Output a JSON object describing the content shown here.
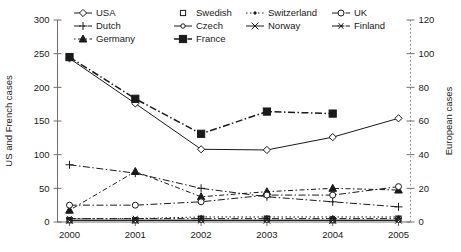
{
  "chart_data": {
    "type": "line",
    "title": "",
    "xlabel": "",
    "categories": [
      "2000",
      "2001",
      "2002",
      "2003",
      "2004",
      "2005"
    ],
    "x": [
      2000,
      2001,
      2002,
      2003,
      2004,
      2005
    ],
    "grid": false,
    "legend_position": "top",
    "axes": {
      "left": {
        "label": "US and French cases",
        "ticks": [
          0,
          50,
          100,
          150,
          200,
          250,
          300
        ],
        "tick_labels": [
          "0",
          "50",
          "100",
          "150",
          "200",
          "250",
          "300"
        ],
        "ylim": [
          0,
          300
        ]
      },
      "right": {
        "label": "European cases",
        "ticks": [
          0,
          20,
          40,
          60,
          80,
          100,
          120
        ],
        "tick_labels": [
          "0",
          "20",
          "40",
          "60",
          "80",
          "100",
          "120"
        ],
        "ylim": [
          0,
          120
        ]
      }
    },
    "series": [
      {
        "name": "USA",
        "axis": "left",
        "marker": "diamond-open",
        "line": "solid",
        "values": [
          243,
          176,
          108,
          107,
          126,
          154
        ]
      },
      {
        "name": "France",
        "axis": "left",
        "marker": "square-filled",
        "line": "dash-dot",
        "values": [
          245,
          183,
          131,
          164,
          161,
          null
        ]
      },
      {
        "name": "Dutch",
        "axis": "right",
        "marker": "plus",
        "line": "dash-dot",
        "values": [
          34,
          29,
          20,
          15,
          12,
          9
        ]
      },
      {
        "name": "Germany",
        "axis": "right",
        "marker": "triangle-filled",
        "line": "dot-dash",
        "values": [
          7,
          30,
          15,
          18,
          20,
          19
        ]
      },
      {
        "name": "UK",
        "axis": "right",
        "marker": "circle-open",
        "line": "dash-dot",
        "values": [
          10,
          10,
          12,
          16,
          16,
          21
        ]
      },
      {
        "name": "Swedish",
        "axis": "right",
        "marker": "square-open",
        "line": "none",
        "values": [
          1,
          1,
          2,
          2,
          1,
          2
        ]
      },
      {
        "name": "Czech",
        "axis": "right",
        "marker": "circle-open-small",
        "line": "solid",
        "values": [
          1,
          1,
          1,
          1,
          1,
          1
        ]
      },
      {
        "name": "Switzerland",
        "axis": "right",
        "marker": "dot",
        "line": "dotted",
        "values": [
          2,
          2,
          3,
          3,
          3,
          3
        ]
      },
      {
        "name": "Norway",
        "axis": "right",
        "marker": "x-cross",
        "line": "solid",
        "values": [
          1,
          1,
          1,
          1,
          1,
          1
        ]
      },
      {
        "name": "Finland",
        "axis": "right",
        "marker": "asterisk",
        "line": "dash-dot",
        "values": [
          2,
          2,
          2,
          2,
          2,
          2
        ]
      }
    ]
  },
  "legend": {
    "entries": [
      {
        "label": "USA",
        "row": 0,
        "col": 0
      },
      {
        "label": "Swedish",
        "row": 0,
        "col": 1
      },
      {
        "label": "Switzerland",
        "row": 0,
        "col": 2
      },
      {
        "label": "UK",
        "row": 0,
        "col": 3
      },
      {
        "label": "Dutch",
        "row": 1,
        "col": 0
      },
      {
        "label": "Czech",
        "row": 1,
        "col": 1
      },
      {
        "label": "Norway",
        "row": 1,
        "col": 2
      },
      {
        "label": "Finland",
        "row": 1,
        "col": 3
      },
      {
        "label": "Germany",
        "row": 2,
        "col": 0
      },
      {
        "label": "France",
        "row": 2,
        "col": 1
      }
    ]
  },
  "colors": {
    "line": "#1a1a1a",
    "axis": "#6e6e6e",
    "background": "#ffffff"
  }
}
